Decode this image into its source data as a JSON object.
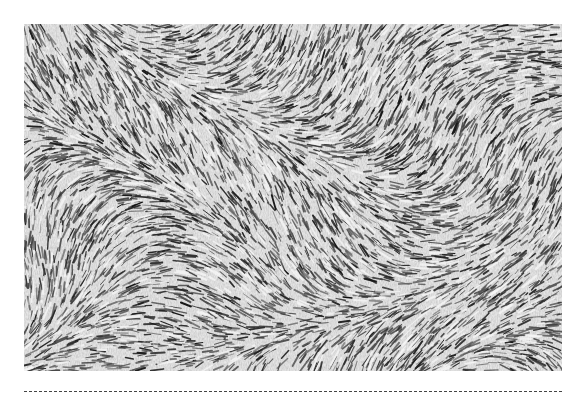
{
  "figure": {
    "type": "grayscale micrograph",
    "description": "Dense spindle-cell tissue with swirling fascicular pattern",
    "colors": {
      "background": "#dcdcdc",
      "nuclei": "#1e1e1e",
      "light": "#f4f4f4"
    }
  },
  "separator": {
    "style": "dashed",
    "color": "#444444"
  }
}
